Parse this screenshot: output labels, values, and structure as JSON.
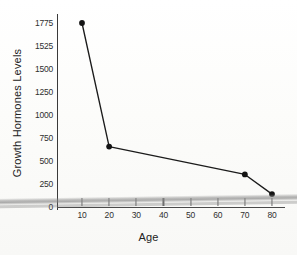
{
  "chart_data": {
    "type": "line",
    "title": "",
    "xlabel": "Age",
    "ylabel": "Growth Hormones Levels",
    "x": [
      10,
      20,
      70,
      80
    ],
    "values": [
      1775,
      580,
      310,
      120
    ],
    "series": [
      {
        "name": "Growth Hormones Levels",
        "points": [
          {
            "x": 10,
            "y": 1775
          },
          {
            "x": 20,
            "y": 580
          },
          {
            "x": 70,
            "y": 310
          },
          {
            "x": 80,
            "y": 120
          }
        ]
      }
    ],
    "x_tick_labels": [
      "10",
      "20",
      "30",
      "40",
      "50",
      "60",
      "70",
      "80"
    ],
    "x_tick_values": [
      10,
      20,
      30,
      40,
      50,
      60,
      70,
      80
    ],
    "y_tick_labels": [
      "1775",
      "1525",
      "1500",
      "1250",
      "1000",
      "750",
      "500",
      "250",
      "0"
    ],
    "y_tick_values": [
      1775,
      1525,
      1500,
      1250,
      1000,
      750,
      500,
      250,
      0
    ],
    "xlim": [
      0,
      85
    ],
    "ylim": [
      0,
      1775
    ],
    "grid": false,
    "legend": false,
    "marker": "filled-circle",
    "line_color": "#1b1b1b",
    "marker_color": "#141414",
    "axis_color": "#3a3a3a",
    "background_color": "#fdfdfb"
  }
}
